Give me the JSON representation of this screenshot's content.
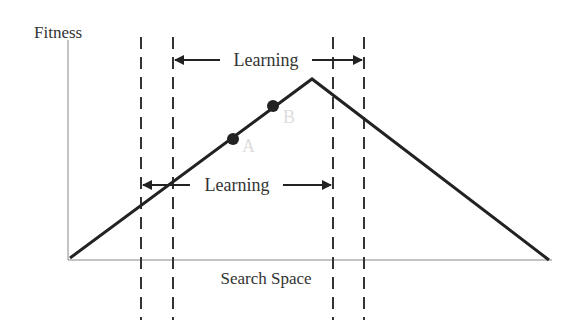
{
  "diagram": {
    "y_axis_label": "Fitness",
    "x_axis_label": "Search Space",
    "top_arrow_label": "Learning",
    "bottom_arrow_label": "Learning",
    "point_a_label": "A",
    "point_b_label": "B",
    "colors": {
      "line": "#222222",
      "axis": "#888888",
      "text": "#333333",
      "point_label": "#dddddd"
    }
  }
}
